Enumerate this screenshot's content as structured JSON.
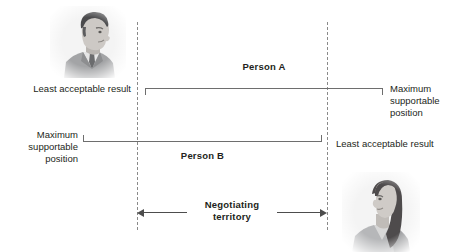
{
  "diagram": {
    "person_a": {
      "name": "Person A",
      "left_label": "Least acceptable result",
      "right_label": "Maximum supportable position"
    },
    "person_b": {
      "name": "Person B",
      "left_label": "Maximum supportable position",
      "right_label": "Least acceptable result"
    },
    "territory": {
      "line1": "Negotiating",
      "line2": "territory"
    },
    "photos": {
      "man": "man-portrait-photo",
      "woman": "woman-portrait-photo"
    },
    "colors": {
      "boundary": "#8a8a8a",
      "bracket": "#6e6e6e",
      "arrow": "#4d4d4d",
      "text": "#231f20",
      "background": "#ffffff"
    }
  }
}
